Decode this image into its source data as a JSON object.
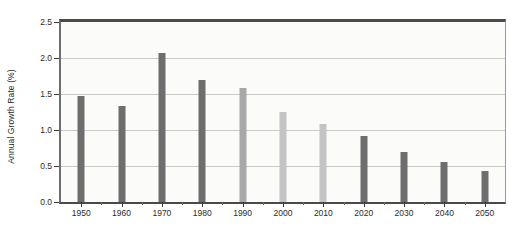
{
  "chart_data": {
    "type": "bar",
    "title": "",
    "xlabel": "",
    "ylabel": "Annual Growth Rate (%)",
    "categories": [
      "1950",
      "1960",
      "1970",
      "1980",
      "1990",
      "2000",
      "2010",
      "2020",
      "2030",
      "2040",
      "2050"
    ],
    "values": [
      1.47,
      1.34,
      2.07,
      1.7,
      1.58,
      1.25,
      1.08,
      0.92,
      0.7,
      0.55,
      0.43
    ],
    "bar_colors": [
      "#6e6e6e",
      "#6e6e6e",
      "#6e6e6e",
      "#6e6e6e",
      "#a8a8a8",
      "#c4c4c4",
      "#c4c4c4",
      "#6e6e6e",
      "#6e6e6e",
      "#6e6e6e",
      "#6e6e6e"
    ],
    "ylim": [
      0.0,
      2.5
    ],
    "y_ticks": [
      "0.0",
      "0.5",
      "1.0",
      "1.5",
      "2.0",
      "2.5"
    ],
    "y_tick_values": [
      0.0,
      0.5,
      1.0,
      1.5,
      2.0,
      2.5
    ],
    "grid": true,
    "grid_axis": "y",
    "legend": "none",
    "plot_background": "#fbfbfa",
    "grid_color": "#c9c9c6",
    "axis_color": "#4a4a4a"
  }
}
